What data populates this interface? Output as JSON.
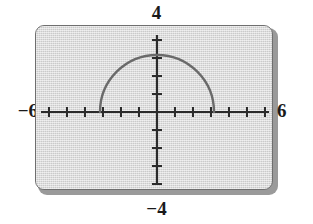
{
  "window_labels": {
    "ymax": "4",
    "ymin": "−4",
    "xmin": "−6",
    "xmax": "6"
  },
  "colors": {
    "screen_background": "#d8d8d8",
    "screen_border": "#6f6f6f",
    "axis": "#2b2b2b",
    "curve": "#6a6a6a",
    "label_text": "#1a1a1a"
  },
  "chart_data": {
    "type": "line",
    "title": "",
    "xlabel": "",
    "ylabel": "",
    "xlim": [
      -6,
      6
    ],
    "ylim": [
      -4,
      4
    ],
    "grid": false,
    "legend": "none",
    "x_tick_interval": 1,
    "y_tick_interval": 1,
    "x_ticks": [
      -6,
      -5,
      -4,
      -3,
      -2,
      -1,
      0,
      1,
      2,
      3,
      4,
      5,
      6
    ],
    "y_ticks": [
      -4,
      -3,
      -2,
      -1,
      0,
      1,
      2,
      3,
      4
    ],
    "tick_labels_shown": false,
    "annotations": [
      "Upper semicircle of radius 3 centered at the origin",
      "y = sqrt(9 - x^2), domain -3 <= x <= 3, range 0 <= y <= 3"
    ],
    "series": [
      {
        "name": "y = sqrt(9 - x^2)",
        "shape": "semicircle",
        "center": [
          0,
          0
        ],
        "radius": 3,
        "x_start": -3,
        "x_end": 3,
        "y_max": 3,
        "x": [
          -3,
          -2.75,
          -2.5,
          -2.25,
          -2,
          -1.75,
          -1.5,
          -1.25,
          -1,
          -0.75,
          -0.5,
          -0.25,
          0,
          0.25,
          0.5,
          0.75,
          1,
          1.25,
          1.5,
          1.75,
          2,
          2.25,
          2.5,
          2.75,
          3
        ],
        "values": [
          0,
          1.2,
          1.66,
          1.98,
          2.24,
          2.44,
          2.6,
          2.73,
          2.83,
          2.9,
          2.96,
          2.99,
          3,
          2.99,
          2.96,
          2.9,
          2.83,
          2.73,
          2.6,
          2.44,
          2.24,
          1.98,
          1.66,
          1.2,
          0
        ]
      }
    ]
  }
}
